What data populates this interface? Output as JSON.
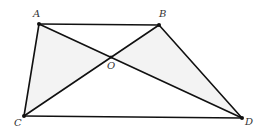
{
  "diagram": {
    "type": "geometry",
    "shape": "trapezoid",
    "points": {
      "A": {
        "x": 39,
        "y": 24,
        "label": "A",
        "lx": 33,
        "ly": 17
      },
      "B": {
        "x": 159,
        "y": 25,
        "label": "B",
        "lx": 159,
        "ly": 17
      },
      "C": {
        "x": 24,
        "y": 116,
        "label": "C",
        "lx": 14,
        "ly": 126
      },
      "D": {
        "x": 242,
        "y": 118,
        "label": "D",
        "lx": 245,
        "ly": 125
      },
      "O": {
        "x": 111,
        "y": 57,
        "label": "O",
        "lx": 107,
        "ly": 69
      }
    },
    "segments": [
      [
        "A",
        "B"
      ],
      [
        "B",
        "D"
      ],
      [
        "C",
        "D"
      ],
      [
        "A",
        "C"
      ],
      [
        "A",
        "D"
      ],
      [
        "B",
        "C"
      ]
    ],
    "shaded_regions": [
      [
        "A",
        "O",
        "C"
      ],
      [
        "B",
        "O",
        "D"
      ]
    ],
    "colors": {
      "shade": "#f3f3f3",
      "line": "#111111",
      "label": "#333333",
      "background": "#ffffff"
    }
  }
}
